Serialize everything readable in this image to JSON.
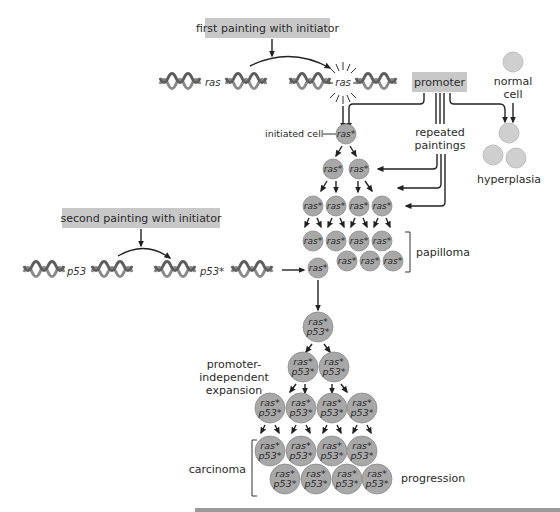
{
  "labels": {
    "first_painting": "first painting with initiator",
    "second_painting": "second painting with initiator",
    "promoter": "promoter",
    "repeated_paintings_1": "repeated",
    "repeated_paintings_2": "paintings",
    "normal_cell_1": "normal",
    "normal_cell_2": "cell",
    "hyperplasia": "hyperplasia",
    "initiated_cell": "initiated cell",
    "papilloma": "papilloma",
    "promoter_independent_1": "promoter-",
    "promoter_independent_2": "independent",
    "promoter_independent_3": "expansion",
    "carcinoma": "carcinoma",
    "progression": "progression"
  },
  "genes": {
    "ras": "ras",
    "ras_mut": "ras",
    "p53": "p53",
    "p53_mut": "p53*"
  },
  "cells": {
    "ras_star": "ras*",
    "ras_line": "ras*",
    "p53_line": "p53*"
  },
  "colors": {
    "label_box": "#c8c8c8",
    "mutant_cell": "#a8a8a8",
    "normal_cell": "#cfcfcf",
    "arrow": "#222222"
  }
}
